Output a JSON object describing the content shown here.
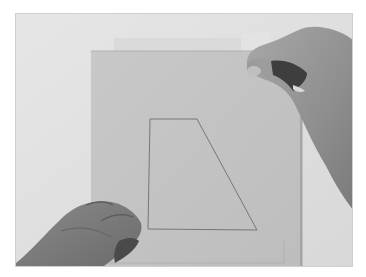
{
  "image": {
    "description": "Photograph of two hands placing a sheet of tracing paper over a cardboard sheet on which a trapezoid outline is drawn",
    "subjects": [
      "left-hand",
      "right-hand",
      "tracing-paper",
      "cardboard-sheet",
      "trapezoid-outline"
    ],
    "colors": {
      "background": "#e2e2e2",
      "cardboard": "#c4c4c4",
      "cardboard_edge": "#b3b3b3",
      "tracing_paper": "#dcdcdc",
      "outline": "#7a7a7a",
      "skin_light": "#9a9a9a",
      "skin_dark": "#6e6e6e"
    },
    "shape": {
      "type": "trapezoid",
      "points": [
        [
          149,
          118
        ],
        [
          196,
          118
        ],
        [
          256,
          229
        ],
        [
          147,
          228
        ]
      ]
    }
  }
}
